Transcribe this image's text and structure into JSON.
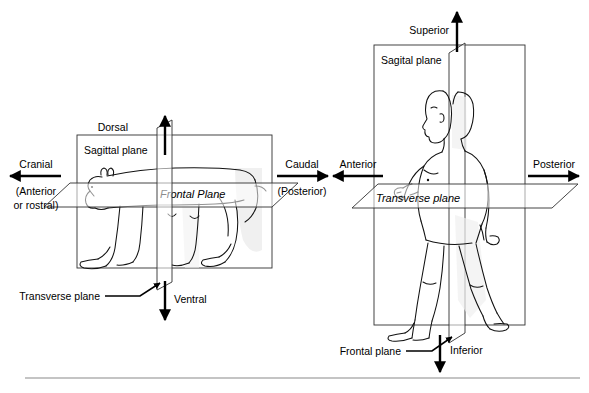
{
  "figure": {
    "divider_rule": true
  },
  "left_diagram": {
    "name": "quadruped-bear-planes",
    "subject": "bear",
    "box_label": "Sagittal plane",
    "frontal_label": "Frontal Plane",
    "transverse_label": "Transverse plane",
    "axes": [
      {
        "id": "dorsal",
        "label": "Dorsal",
        "direction": "up"
      },
      {
        "id": "ventral",
        "label": "Ventral",
        "direction": "down"
      },
      {
        "id": "cranial",
        "label": "Cranial",
        "sub_line_1": "(Anterior",
        "sub_line_2": "or rostral)",
        "direction": "left"
      },
      {
        "id": "caudal",
        "label": "Caudal",
        "sub_line_1": "(Posterior)",
        "direction": "right"
      }
    ]
  },
  "right_diagram": {
    "name": "human-planes",
    "subject": "human",
    "box_label": "Sagital plane",
    "transverse_label": "Transverse plane",
    "frontal_label": "Frontal plane",
    "axes": [
      {
        "id": "superior",
        "label": "Superior",
        "direction": "up"
      },
      {
        "id": "inferior",
        "label": "Inferior",
        "direction": "down"
      },
      {
        "id": "anterior",
        "label": "Anterior",
        "direction": "left"
      },
      {
        "id": "posterior",
        "label": "Posterior",
        "direction": "right"
      }
    ]
  },
  "colors": {
    "background": "#ffffff",
    "ink": "#111111",
    "box_line": "#303030",
    "shade": "#f0f0f0",
    "rule": "#8a8a8a"
  }
}
